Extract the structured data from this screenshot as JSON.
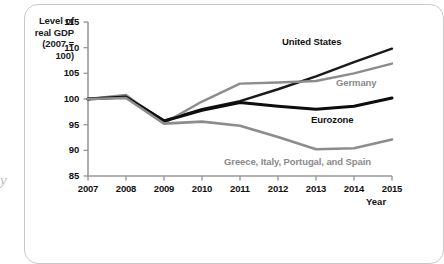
{
  "figure": {
    "y_axis_caption_lines": [
      "Level of",
      "real GDP",
      "(2007 =",
      "100)"
    ],
    "x_axis_caption": "Year",
    "margin_glyph": "y"
  },
  "chart_data": {
    "type": "line",
    "title": "",
    "subtitle": "",
    "xlabel": "Year",
    "ylabel": "Level of real GDP (2007 = 100)",
    "x": [
      2007,
      2008,
      2009,
      2010,
      2011,
      2012,
      2013,
      2014,
      2015
    ],
    "categories": [
      "2007",
      "2008",
      "2009",
      "2010",
      "2011",
      "2012",
      "2013",
      "2014",
      "2015"
    ],
    "xlim": [
      2007,
      2015
    ],
    "ylim": [
      85,
      115
    ],
    "yticks": [
      85,
      90,
      95,
      100,
      105,
      110,
      115
    ],
    "ytick_labels": [
      "85",
      "90",
      "95",
      "100",
      "105",
      "110",
      "115"
    ],
    "xticks": [
      2007,
      2008,
      2009,
      2010,
      2011,
      2012,
      2013,
      2014,
      2015
    ],
    "xtick_labels": [
      "2007",
      "2008",
      "2009",
      "2010",
      "2011",
      "2012",
      "2013",
      "2014",
      "2015"
    ],
    "grid": false,
    "legend_position": "inline-annotations",
    "series": [
      {
        "name": "United States",
        "color": "#1a1a1a",
        "width": 2.4,
        "values": [
          100.0,
          100.5,
          95.8,
          98.0,
          99.6,
          101.9,
          104.4,
          107.2,
          109.8
        ],
        "label": "United States",
        "label_style": "dark",
        "label_x": 282,
        "label_y": 36
      },
      {
        "name": "Germany",
        "color": "#8c8c8c",
        "width": 2.4,
        "values": [
          100.0,
          100.8,
          95.3,
          99.5,
          103.0,
          103.2,
          103.5,
          105.0,
          106.9
        ],
        "label": "Germany",
        "label_style": "gray",
        "label_x": 336,
        "label_y": 77
      },
      {
        "name": "Eurozone",
        "color": "#0d0d0d",
        "width": 3.0,
        "values": [
          100.0,
          100.4,
          95.7,
          97.8,
          99.3,
          98.6,
          98.0,
          98.6,
          100.2
        ],
        "label": "Eurozone",
        "label_style": "dark",
        "label_x": 311,
        "label_y": 114
      },
      {
        "name": "Greece, Italy, Portugal, and Spain",
        "color": "#8c8c8c",
        "width": 2.6,
        "values": [
          100.0,
          100.2,
          95.2,
          95.6,
          94.8,
          92.6,
          90.2,
          90.4,
          92.1
        ],
        "label": "Greece, Italy, Portugal, and Spain",
        "label_style": "gray",
        "label_x": 224,
        "label_y": 156
      }
    ],
    "axis_color": "#9a9a9a"
  }
}
